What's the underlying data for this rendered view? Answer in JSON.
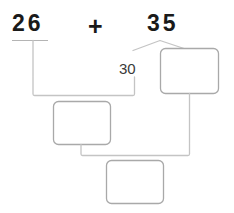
{
  "worksheet": {
    "expression": {
      "left_addend": "26",
      "operator": "+",
      "right_addend": "35"
    },
    "decomposition_label": "30",
    "answer_boxes": [
      {
        "name": "middle-answer-box",
        "value": ""
      },
      {
        "name": "right-answer-box",
        "value": ""
      },
      {
        "name": "bottom-answer-box",
        "value": ""
      }
    ],
    "colors": {
      "text": "#1a1a1a",
      "label_text": "#3a3a3a",
      "box_stroke": "#a9a9a9",
      "connector_stroke": "#c0c0c0",
      "underline_stroke": "#b4b4b4",
      "background": "#ffffff"
    }
  }
}
